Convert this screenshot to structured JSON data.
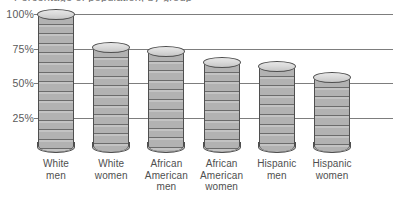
{
  "title_clipped": "Percentage of population, by group",
  "chart_data": {
    "type": "bar",
    "title": "Percentage of population, by group",
    "xlabel": "",
    "ylabel": "",
    "ylim": [
      0,
      100
    ],
    "grid": true,
    "legend": "none",
    "style": "3d-cylinder",
    "bar_fill_color": "#b8b8b8",
    "bar_outline_color": "#4f4f4f",
    "gridline_color": "#7d7d7d",
    "categories": [
      "White men",
      "White women",
      "African American men",
      "African American women",
      "Hispanic men",
      "Hispanic women"
    ],
    "category_lines": [
      [
        "White",
        "men"
      ],
      [
        "White",
        "women"
      ],
      [
        "African",
        "American",
        "men"
      ],
      [
        "African",
        "American",
        "women"
      ],
      [
        "Hispanic",
        "men"
      ],
      [
        "Hispanic",
        "women"
      ]
    ],
    "values": [
      100,
      76,
      73,
      65,
      62,
      54
    ],
    "yticks": [
      100,
      75,
      50,
      25
    ],
    "ytick_labels": [
      "100%",
      "75%",
      "50%",
      "25%"
    ]
  }
}
